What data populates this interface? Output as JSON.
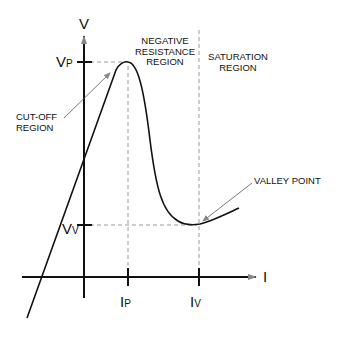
{
  "diagram": {
    "axes": {
      "y_label": "V",
      "x_label": "I"
    },
    "ticks": {
      "vp": {
        "main": "V",
        "sub": "P"
      },
      "vv": {
        "main": "V",
        "sub": "V"
      },
      "ip": {
        "main": "I",
        "sub": "P"
      },
      "iv": {
        "main": "I",
        "sub": "V"
      }
    },
    "regions": {
      "cutoff": [
        "CUT-OFF",
        "REGION"
      ],
      "negative": [
        "NEGATIVE",
        "RESISTANCE",
        "REGION"
      ],
      "saturation": [
        "SATURATION",
        "REGION"
      ]
    },
    "annotations": {
      "valley_point": "VALLEY POINT"
    },
    "colors": {
      "ink": "#111111",
      "dash": "#9a9a9a",
      "arrow": "#777777"
    }
  }
}
